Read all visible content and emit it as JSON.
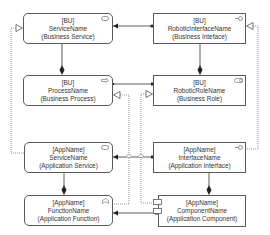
{
  "diagram": {
    "type": "ArchiMate-style layered architecture view",
    "colors": {
      "line": "#333333",
      "node_border": "#5a5a5a",
      "text": "#333333",
      "dotted": "#7a7a7a",
      "background": "#ffffff"
    },
    "nodes": [
      {
        "id": "bu-service",
        "prefix": "[BU]",
        "name": "ServiceName",
        "type": "(Business Service)",
        "icon": "service-icon"
      },
      {
        "id": "bu-interface",
        "prefix": "[BU]",
        "name": "RoboticInterfaceName",
        "type": "(Business Inteface)",
        "icon": "interface-icon"
      },
      {
        "id": "bu-process",
        "prefix": "[BU]",
        "name": "ProcessName",
        "type": "(Business Process)",
        "icon": "process-icon"
      },
      {
        "id": "bu-role",
        "prefix": "[BU]",
        "name": "RoboticRoleName",
        "type": "(Business Role)",
        "icon": "role-icon"
      },
      {
        "id": "app-service",
        "prefix": "[AppName]",
        "name": "ServiceName",
        "type": "(Application Service)",
        "icon": "service-icon"
      },
      {
        "id": "app-interface",
        "prefix": "[AppName]",
        "name": "InterfaceName",
        "type": "(Application Interface)",
        "icon": "interface-icon"
      },
      {
        "id": "app-function",
        "prefix": "[AppName]",
        "name": "FunctionName",
        "type": "(Application Function)",
        "icon": "function-icon"
      },
      {
        "id": "app-component",
        "prefix": "[AppName]",
        "name": "ComponentName",
        "type": "(Application Component)",
        "icon": "component-icon"
      }
    ],
    "edges": [
      {
        "from": "bu-interface",
        "to": "bu-service",
        "kind": "assignment"
      },
      {
        "from": "bu-role",
        "to": "bu-process",
        "kind": "assignment"
      },
      {
        "from": "bu-service",
        "to": "bu-process",
        "kind": "composition"
      },
      {
        "from": "bu-interface",
        "to": "bu-role",
        "kind": "composition"
      },
      {
        "from": "app-service",
        "to": "bu-service",
        "kind": "realization"
      },
      {
        "from": "app-interface",
        "to": "bu-interface",
        "kind": "realization"
      },
      {
        "from": "app-function",
        "to": "bu-process",
        "kind": "realization"
      },
      {
        "from": "app-component",
        "to": "bu-role",
        "kind": "realization"
      },
      {
        "from": "app-interface",
        "to": "app-service",
        "kind": "assignment"
      },
      {
        "from": "app-component",
        "to": "app-function",
        "kind": "assignment"
      },
      {
        "from": "app-service",
        "to": "app-function",
        "kind": "composition"
      },
      {
        "from": "app-interface",
        "to": "app-component",
        "kind": "composition"
      }
    ]
  }
}
